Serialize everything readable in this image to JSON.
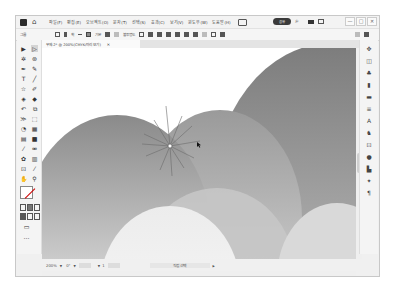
{
  "app": {
    "name": "Adobe Illustrator"
  },
  "titlebar": {
    "menu": [
      "파일(F)",
      "편집(E)",
      "오브젝트(O)",
      "문자(T)",
      "선택(S)",
      "효과(C)",
      "보기(V)",
      "윈도우(W)",
      "도움말(H)"
    ],
    "share_label": "공유",
    "window_controls": [
      "—",
      "□",
      "✕"
    ]
  },
  "control_bar": {
    "selection_label": "그룹",
    "stroke_label": "획",
    "style_label": "기본",
    "opacity_label": "불투명도"
  },
  "document_tab": {
    "title": "무제-2* @ 200%(CMYK/미리 보기)",
    "close": "✕"
  },
  "status_bar": {
    "zoom": "200%",
    "rotation": "0°",
    "artboard": "1",
    "current_tool": "직접 선택"
  },
  "icons": {
    "tools": [
      "selection-tool",
      "direct-selection-tool",
      "magic-wand-tool",
      "lasso-tool",
      "pen-tool",
      "curvature-tool",
      "type-tool",
      "line-tool",
      "rectangle-tool",
      "paintbrush-tool",
      "shaper-tool",
      "eraser-tool",
      "rotate-tool",
      "scale-tool",
      "width-tool",
      "free-transform-tool",
      "shape-builder-tool",
      "perspective-tool",
      "mesh-tool",
      "gradient-tool",
      "eyedropper-tool",
      "blend-tool",
      "symbol-sprayer-tool",
      "graph-tool",
      "artboard-tool",
      "slice-tool",
      "hand-tool",
      "zoom-tool"
    ],
    "right_panel": [
      "properties-panel",
      "layers-panel",
      "libraries-panel",
      "color-panel",
      "swatches-panel",
      "stroke-panel",
      "character-panel",
      "symbols-panel",
      "artboards-panel",
      "appearance-panel",
      "graphic-styles-panel",
      "transform-panel",
      "paragraph-panel"
    ]
  }
}
